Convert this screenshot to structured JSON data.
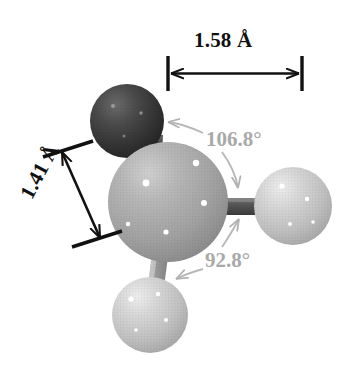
{
  "figure": {
    "background_color": "#ffffff"
  },
  "annotations": {
    "bond_length_top": {
      "text": "1.58 Å",
      "color": "#111111",
      "orientation": "horizontal",
      "description": "horizontal double-headed dimension arrow above the molecule"
    },
    "bond_length_left": {
      "text": "1.41 Å",
      "color": "#111111",
      "orientation": "rotated -62 degrees",
      "description": "diagonal double-headed dimension arrow at the left of the molecule"
    },
    "bond_angle_upper": {
      "text": "106.8°",
      "color": "#a9a9a9",
      "description": "grey label with two leader arrows, one to the dark sphere and one to the central sphere"
    },
    "bond_angle_lower": {
      "text": "92.8°",
      "color": "#a9a9a9",
      "description": "grey label with two leader arrows, one up to the horizontal bond and one left to the lower bond"
    }
  },
  "model": {
    "atoms": [
      {
        "name": "atom-dark-upper-left",
        "cx": 127,
        "cy": 121,
        "r": 37,
        "fill": "#3d3d3d",
        "highlight_color": "#8d8d8d",
        "shade": "dark"
      },
      {
        "name": "atom-central",
        "cx": 168,
        "cy": 202,
        "r": 60,
        "fill": "#ababab",
        "highlight_color": "#ffffff",
        "shade": "medium"
      },
      {
        "name": "atom-right",
        "cx": 293,
        "cy": 206,
        "r": 39,
        "fill": "#c6c6c6",
        "highlight_color": "#ffffff",
        "shade": "light"
      },
      {
        "name": "atom-bottom",
        "cx": 150,
        "cy": 315,
        "r": 38,
        "fill": "#c2c2c2",
        "highlight_color": "#ffffff",
        "shade": "light"
      }
    ],
    "bonds": [
      {
        "name": "bond-dark-to-central",
        "from": "atom-dark-upper-left",
        "to": "atom-central",
        "color": "#4a4a4a",
        "width": 15
      },
      {
        "name": "bond-central-to-right",
        "from": "atom-central",
        "to": "atom-right",
        "color": "#5a5a5a",
        "width": 17
      },
      {
        "name": "bond-central-to-bottom",
        "from": "atom-central",
        "to": "atom-bottom",
        "color": "#9e9e9e",
        "width": 16
      }
    ]
  }
}
